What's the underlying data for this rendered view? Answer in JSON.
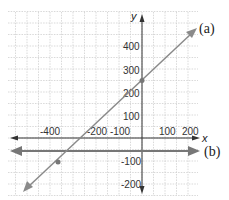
{
  "chart_data": {
    "type": "line",
    "title": "",
    "xlabel": "x",
    "ylabel": "y",
    "xlim": [
      -550,
      250
    ],
    "ylim": [
      -250,
      550
    ],
    "grid": true,
    "grid_step": 50,
    "x_ticks": [
      -400,
      -200,
      -100,
      100,
      200
    ],
    "x_tick_labels": [
      "-400",
      "-200",
      "-100",
      "100",
      "200"
    ],
    "y_ticks": [
      400,
      300,
      200,
      100,
      -100,
      -200
    ],
    "y_tick_labels": [
      "400",
      "300",
      "200",
      "100",
      "-100",
      "-200"
    ],
    "series": [
      {
        "name": "(a)",
        "equation": "y = x + 250",
        "points": [
          {
            "x": 0,
            "y": 250
          },
          {
            "x": -350,
            "y": -100
          }
        ],
        "color": "#8a8a8a"
      },
      {
        "name": "(b)",
        "equation": "y = -50",
        "points": [],
        "color": "#777777"
      }
    ],
    "annotations": [
      "(a)",
      "(b)"
    ]
  },
  "labels": {
    "x_axis": "x",
    "y_axis": "y",
    "line_a": "(a)",
    "line_b": "(b)",
    "ticks": {
      "xm400": "-400",
      "xm200": "-200",
      "xm100": "-100",
      "x100": "100",
      "x200": "200",
      "y400": "400",
      "y300": "300",
      "y200": "200",
      "y100": "100",
      "ym100": "-100",
      "ym200": "-200"
    }
  }
}
